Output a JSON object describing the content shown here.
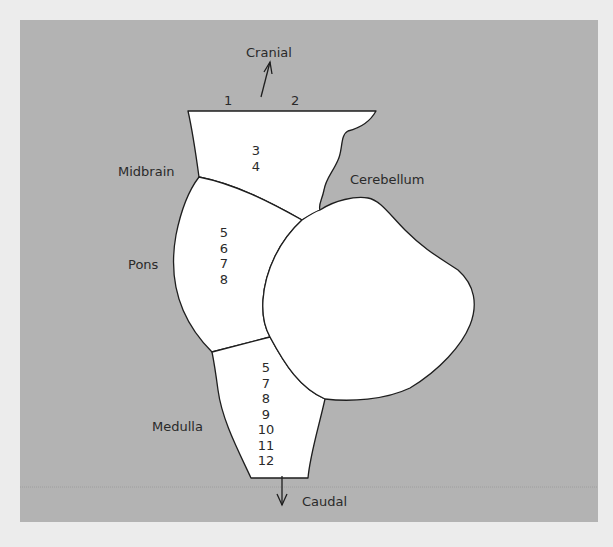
{
  "colors": {
    "paper": "#ececec",
    "panel": "#b3b3b3",
    "region_fill": "#ffffff",
    "outline": "#1e1e1e",
    "text": "#2a2a2a"
  },
  "directions": {
    "top": "Cranial",
    "bottom": "Caudal"
  },
  "regions": {
    "midbrain": "Midbrain",
    "pons": "Pons",
    "medulla": "Medulla",
    "cerebellum": "Cerebellum"
  },
  "cranial_nerves": {
    "top_left": "1",
    "top_right": "2",
    "midbrain": [
      "3",
      "4"
    ],
    "pons": [
      "5",
      "6",
      "7",
      "8"
    ],
    "medulla": [
      "5",
      "7",
      "8",
      "9",
      "10",
      "11",
      "12"
    ]
  }
}
